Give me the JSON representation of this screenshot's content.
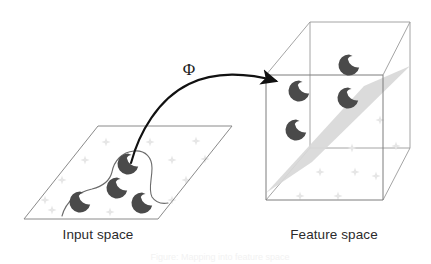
{
  "figure": {
    "type": "diagram",
    "background_color": "#ffffff",
    "width": 431,
    "height": 264
  },
  "labels": {
    "input_space": "Input space",
    "feature_space": "Feature space",
    "mapping_symbol": "Φ",
    "caption_faint": "Figure: Mapping into feature space"
  },
  "colors": {
    "marker_dark": "#4a4a4a",
    "marker_faint": "#e8e8e8",
    "wireframe": "#6e6e6e",
    "plane_outline": "#7a7a7a",
    "hyperplane_fill": "#d6d6d6",
    "arrow": "#111111",
    "boundary_curve": "#6b6b6b",
    "text": "#2b2b2b"
  },
  "input_space": {
    "plane_corners": [
      [
        98,
        126
      ],
      [
        232,
        126
      ],
      [
        158,
        219
      ],
      [
        24,
        219
      ]
    ],
    "dark_markers": [
      {
        "cx": 128,
        "cy": 164,
        "r": 11
      },
      {
        "cx": 117,
        "cy": 188,
        "r": 11
      },
      {
        "cx": 80,
        "cy": 202,
        "r": 11
      },
      {
        "cx": 142,
        "cy": 203,
        "r": 11
      }
    ],
    "faint_markers": [
      {
        "cx": 106,
        "cy": 142
      },
      {
        "cx": 150,
        "cy": 142
      },
      {
        "cx": 196,
        "cy": 141
      },
      {
        "cx": 85,
        "cy": 160
      },
      {
        "cx": 172,
        "cy": 160
      },
      {
        "cx": 205,
        "cy": 159
      },
      {
        "cx": 62,
        "cy": 180
      },
      {
        "cx": 186,
        "cy": 180
      },
      {
        "cx": 45,
        "cy": 200
      },
      {
        "cx": 172,
        "cy": 200
      },
      {
        "cx": 52,
        "cy": 210
      },
      {
        "cx": 110,
        "cy": 212
      }
    ],
    "decision_boundary": "wavy separating curve"
  },
  "feature_space": {
    "cube_front_face": [
      [
        266,
        75
      ],
      [
        383,
        75
      ],
      [
        383,
        200
      ],
      [
        266,
        200
      ]
    ],
    "cube_back_face": [
      [
        310,
        22
      ],
      [
        410,
        22
      ],
      [
        410,
        148
      ],
      [
        310,
        148
      ]
    ],
    "dark_markers": [
      {
        "cx": 349,
        "cy": 65,
        "r": 11
      },
      {
        "cx": 299,
        "cy": 91,
        "r": 11
      },
      {
        "cx": 348,
        "cy": 98,
        "r": 11
      },
      {
        "cx": 296,
        "cy": 130,
        "r": 11
      }
    ],
    "faint_markers": [
      {
        "cx": 380,
        "cy": 120
      },
      {
        "cx": 352,
        "cy": 148
      },
      {
        "cx": 396,
        "cy": 146
      },
      {
        "cx": 320,
        "cy": 172
      },
      {
        "cx": 355,
        "cy": 172
      },
      {
        "cx": 300,
        "cy": 196
      },
      {
        "cx": 338,
        "cy": 196
      },
      {
        "cx": 376,
        "cy": 176
      }
    ],
    "hyperplane_corners": [
      [
        266,
        193
      ],
      [
        363,
        88
      ],
      [
        410,
        68
      ],
      [
        312,
        160
      ]
    ],
    "hyperplane_description": "tilted separating hyperplane"
  },
  "mapping_arrow": {
    "from": [
      131,
      163
    ],
    "to": [
      285,
      83
    ],
    "label": "Φ",
    "style": "curved-arrow"
  }
}
